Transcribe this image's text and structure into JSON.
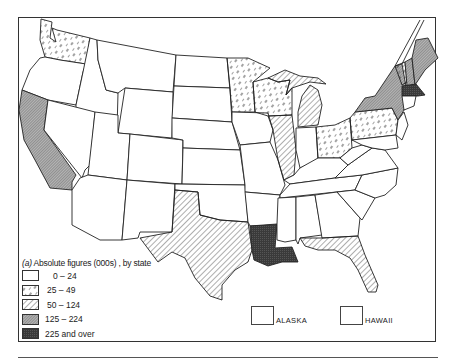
{
  "map": {
    "title_prefix": "(a)",
    "title": "Absolute figures (000s) , by state",
    "legend": [
      {
        "label": "0 – 24",
        "category": "none"
      },
      {
        "label": "25 – 49",
        "category": "sparse-dash"
      },
      {
        "label": "50 – 124",
        "category": "diagonal-hatch"
      },
      {
        "label": "125 – 224",
        "category": "dense-hatch"
      },
      {
        "label": "225 and over",
        "category": "solid-dark"
      }
    ],
    "insets": [
      {
        "label": "ALASKA"
      },
      {
        "label": "HAWAII"
      }
    ],
    "states": {
      "25-49": [
        "Washington",
        "Minnesota",
        "Wisconsin",
        "Ohio",
        "Pennsylvania",
        "Vermont"
      ],
      "50-124": [
        "Texas",
        "Illinois",
        "Michigan",
        "Florida"
      ],
      "125-224": [
        "California",
        "New York",
        "Maine",
        "New Hampshire"
      ],
      "225 and over": [
        "Louisiana",
        "Massachusetts"
      ]
    },
    "colors": {
      "line": "#222222",
      "dense": "#9a9a9a",
      "dark": "#3a3a3a"
    }
  }
}
